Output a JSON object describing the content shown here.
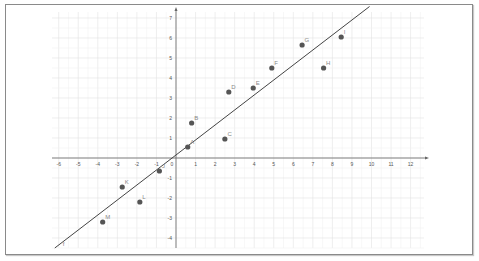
{
  "chart_data": {
    "type": "scatter",
    "title": "",
    "xlabel": "",
    "ylabel": "",
    "xlim": [
      -6.3,
      12.6
    ],
    "ylim": [
      -4.5,
      7.3
    ],
    "grid": true,
    "x_ticks": [
      -6,
      -5,
      -4,
      -3,
      -2,
      -1,
      0,
      1,
      2,
      3,
      4,
      5,
      6,
      7,
      8,
      9,
      10,
      11,
      12
    ],
    "y_ticks": [
      -4,
      -3,
      -2,
      -1,
      1,
      2,
      3,
      4,
      5,
      6,
      7
    ],
    "points": [
      {
        "label": "A",
        "x": 0.6,
        "y": 0.55
      },
      {
        "label": "B",
        "x": 0.8,
        "y": 1.75
      },
      {
        "label": "C",
        "x": 2.5,
        "y": 0.95
      },
      {
        "label": "D",
        "x": 2.7,
        "y": 3.3
      },
      {
        "label": "E",
        "x": 3.95,
        "y": 3.5
      },
      {
        "label": "F",
        "x": 4.9,
        "y": 4.5
      },
      {
        "label": "G",
        "x": 6.45,
        "y": 5.65
      },
      {
        "label": "H",
        "x": 7.55,
        "y": 4.5
      },
      {
        "label": "I",
        "x": 8.45,
        "y": 6.05
      },
      {
        "label": "J",
        "x": -0.85,
        "y": -0.65
      },
      {
        "label": "K",
        "x": -2.75,
        "y": -1.45
      },
      {
        "label": "L",
        "x": -1.85,
        "y": -2.2
      },
      {
        "label": "M",
        "x": -3.75,
        "y": -3.2
      }
    ],
    "regression_line": {
      "label": "f",
      "slope": 0.75,
      "intercept": 0.15,
      "x_start": -6.2,
      "x_end": 9.9
    },
    "colors": {
      "point": "#555555",
      "line": "#444444",
      "grid": "#e6e6e6",
      "axis": "#666666"
    }
  }
}
